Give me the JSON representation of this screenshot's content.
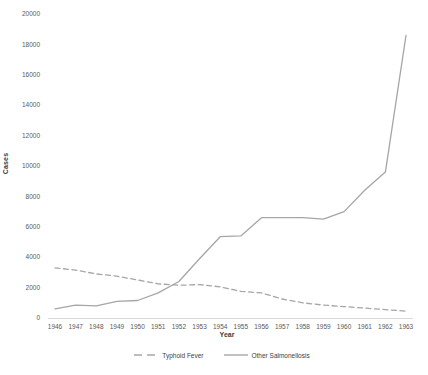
{
  "chart_data": {
    "type": "line",
    "categories": [
      "1946",
      "1947",
      "1948",
      "1949",
      "1950",
      "1951",
      "1952",
      "1953",
      "1954",
      "1955",
      "1956",
      "1957",
      "1958",
      "1959",
      "1960",
      "1961",
      "1962",
      "1963"
    ],
    "series": [
      {
        "name": "Typhoid Fever",
        "style": "dashed",
        "color": "#a6a6a6",
        "values": [
          3300,
          3150,
          2900,
          2750,
          2500,
          2250,
          2150,
          2200,
          2050,
          1750,
          1650,
          1250,
          1000,
          850,
          750,
          650,
          550,
          450
        ]
      },
      {
        "name": "Other Salmonellosis",
        "style": "solid",
        "color": "#a6a6a6",
        "values": [
          600,
          850,
          800,
          1100,
          1150,
          1650,
          2400,
          3900,
          5350,
          5400,
          6600,
          6600,
          6600,
          6500,
          7000,
          8400,
          9600,
          18600
        ]
      }
    ],
    "xlabel": "Year",
    "ylabel": "Cases",
    "ylim": [
      0,
      20000
    ],
    "yticks": [
      0,
      2000,
      4000,
      6000,
      8000,
      10000,
      12000,
      14000,
      16000,
      18000,
      20000
    ],
    "grid": false,
    "legend_position": "bottom",
    "colors": {
      "tick_label": "#595959",
      "axis_title": "#404040",
      "axis_line": "#d9d9d9",
      "background": "#ffffff"
    }
  }
}
